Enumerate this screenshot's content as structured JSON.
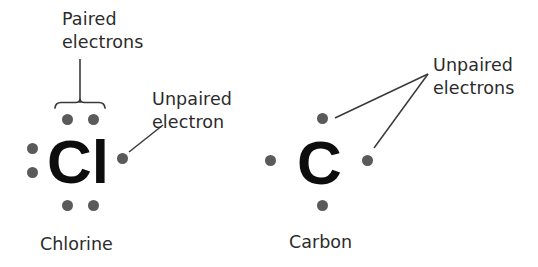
{
  "figure": {
    "type": "lewis-dot-structure-diagram",
    "background_color": "#ffffff",
    "dot_color": "#5a5a5a",
    "symbol_color": "#0d0d0d",
    "text_color": "#2b2b2b",
    "line_color": "#3a3a3a"
  },
  "annotations": {
    "paired_electrons": {
      "line1": "Paired",
      "line2": "electrons"
    },
    "unpaired_electron_singular": {
      "line1": "Unpaired",
      "line2": "electron"
    },
    "unpaired_electrons_plural": {
      "line1": "Unpaired",
      "line2": "electrons"
    }
  },
  "atoms": [
    {
      "id": "chlorine",
      "symbol": "Cl",
      "name": "Chlorine",
      "valence_electrons": 7,
      "dot_groups": {
        "top": 2,
        "left": 2,
        "bottom": 2,
        "right": 1
      },
      "paired_pairs": 3,
      "unpaired": 1
    },
    {
      "id": "carbon",
      "symbol": "C",
      "name": "Carbon",
      "valence_electrons": 4,
      "dot_groups": {
        "top": 1,
        "left": 1,
        "bottom": 1,
        "right": 1
      },
      "paired_pairs": 0,
      "unpaired": 4
    }
  ]
}
